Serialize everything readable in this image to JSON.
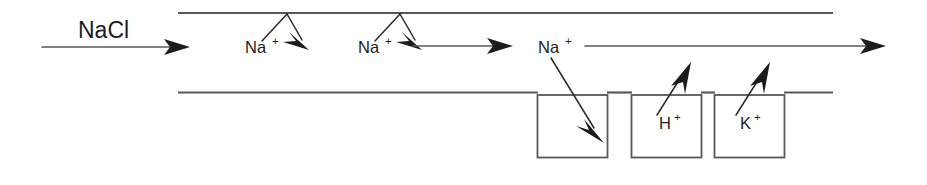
{
  "diagram": {
    "type": "process-flow",
    "canvas": {
      "width": 927,
      "height": 185
    },
    "colors": {
      "background": "#ffffff",
      "tube_stroke": "#58585a",
      "arrow_fill": "#1c1c1e",
      "text": "#1c1c1e"
    },
    "inflow": {
      "label": "NaCl",
      "arrow_from_x": 42,
      "arrow_to_x": 190,
      "arrow_y": 47
    },
    "tube": {
      "top_line_y": 13,
      "bottom_line_y": 92,
      "start_x": 178,
      "end_x": 833
    },
    "lumen_flow": {
      "segments": [
        {
          "from_x": 412,
          "to_x": 512,
          "y": 46
        },
        {
          "from_x": 585,
          "to_x": 886,
          "y": 46
        }
      ]
    },
    "ion_labels": [
      {
        "name": "sodium-1",
        "base": "Na",
        "charge": "+",
        "x": 245,
        "y": 52
      },
      {
        "name": "sodium-2",
        "base": "Na",
        "charge": "+",
        "x": 358,
        "y": 52
      },
      {
        "name": "sodium-3",
        "base": "Na",
        "charge": "+",
        "x": 538,
        "y": 52
      },
      {
        "name": "hydrogen-1",
        "base": "H",
        "charge": "+",
        "x": 658,
        "y": 128
      },
      {
        "name": "potassium-1",
        "base": "K",
        "charge": "+",
        "x": 737,
        "y": 128
      }
    ],
    "membrane_crossings": [
      {
        "name": "sodium-reabsorption-1",
        "apex_x": 287,
        "apex_y": 13,
        "in_x": 262,
        "in_y": 41,
        "out_x": 307,
        "out_y": 47
      },
      {
        "name": "sodium-reabsorption-2",
        "apex_x": 400,
        "apex_y": 13,
        "in_x": 375,
        "in_y": 41,
        "out_x": 420,
        "out_y": 47
      }
    ],
    "exchanger_boxes": [
      {
        "name": "sodium-channel-box",
        "x": 537,
        "y": 95,
        "width": 71,
        "height": 63,
        "label": ""
      },
      {
        "name": "hydrogen-exchanger-box",
        "x": 631,
        "y": 95,
        "width": 71,
        "height": 63,
        "label": "H+"
      },
      {
        "name": "potassium-exchanger-box",
        "x": 714,
        "y": 95,
        "width": 71,
        "height": 63,
        "label": "K+"
      }
    ],
    "transport_arrows": [
      {
        "name": "sodium-into-cell-arrow",
        "from_x": 551,
        "from_y": 58,
        "to_x": 601,
        "to_y": 139,
        "direction": "down-right"
      },
      {
        "name": "hydrogen-out-arrow",
        "from_x": 659,
        "from_y": 116,
        "to_x": 689,
        "to_y": 66,
        "direction": "up-right"
      },
      {
        "name": "potassium-out-arrow",
        "from_x": 738,
        "from_y": 116,
        "to_x": 768,
        "to_y": 66,
        "direction": "up-right"
      }
    ]
  }
}
